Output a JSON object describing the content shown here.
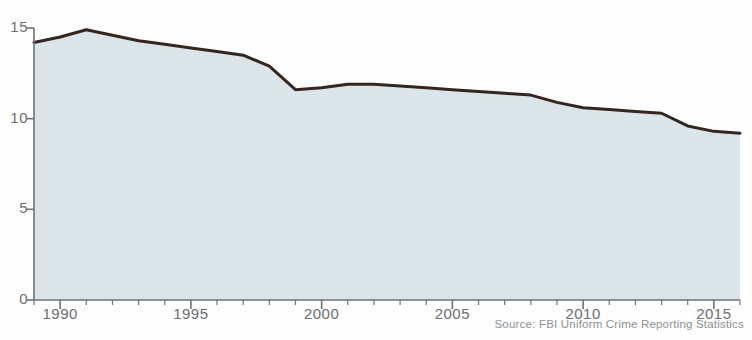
{
  "source": {
    "text": "Source: FBI Uniform Crime Reporting Statistics"
  },
  "axes": {
    "y_ticks": [
      "0",
      "5",
      "10",
      "15"
    ],
    "x_ticks": [
      "1990",
      "1995",
      "2000",
      "2005",
      "2010",
      "2015"
    ]
  },
  "chart_data": {
    "type": "area",
    "title": "",
    "subtitle": "",
    "xlabel": "",
    "ylabel": "",
    "xlim": [
      1989,
      2016
    ],
    "ylim": [
      0,
      15.8
    ],
    "grid": false,
    "legend": false,
    "y_tick_values": [
      0,
      5,
      10,
      15
    ],
    "x_tick_values": [
      1990,
      1995,
      2000,
      2005,
      2010,
      2015
    ],
    "x_minor_tick_step": 1,
    "annotations": [
      "Source: FBI Uniform Crime Reporting Statistics"
    ],
    "line_color": "#33261f",
    "fill_color": "#dde6ea",
    "x": [
      1989,
      1990,
      1991,
      1992,
      1993,
      1994,
      1995,
      1996,
      1997,
      1998,
      1999,
      2000,
      2001,
      2002,
      2003,
      2004,
      2005,
      2006,
      2007,
      2008,
      2009,
      2010,
      2011,
      2012,
      2013,
      2014,
      2015,
      2016
    ],
    "values": [
      14.2,
      14.5,
      14.9,
      14.6,
      14.3,
      14.1,
      13.9,
      13.7,
      13.5,
      12.9,
      11.6,
      11.7,
      11.9,
      11.9,
      11.8,
      11.7,
      11.6,
      11.5,
      11.4,
      11.3,
      10.9,
      10.6,
      10.5,
      10.4,
      10.3,
      9.6,
      9.3,
      9.2
    ],
    "series": [
      {
        "name": "Rate",
        "values": [
          14.2,
          14.5,
          14.9,
          14.6,
          14.3,
          14.1,
          13.9,
          13.7,
          13.5,
          12.9,
          11.6,
          11.7,
          11.9,
          11.9,
          11.8,
          11.7,
          11.6,
          11.5,
          11.4,
          11.3,
          10.9,
          10.6,
          10.5,
          10.4,
          10.3,
          9.6,
          9.3,
          9.2
        ]
      }
    ]
  }
}
